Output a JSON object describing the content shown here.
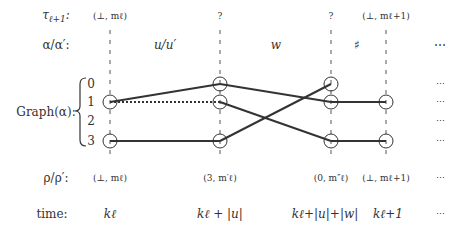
{
  "rows": {
    "tau": "τ",
    "tau_sub": "ℓ+1",
    "tau_suffix": ":",
    "alpha": "α/α′:",
    "graph": "Graph(α):",
    "rho": "ρ/ρ′:",
    "time": "time:"
  },
  "tau_values": [
    "(⊥, mℓ)",
    "?",
    "?",
    "(⊥, mℓ+1)"
  ],
  "segments": [
    "u/u′",
    "w",
    "♯",
    "⋯"
  ],
  "graph_row_labels": [
    "0",
    "1",
    "2",
    "3"
  ],
  "graph_ellipsis": [
    "⋯",
    "⋯",
    "⋯",
    "⋯"
  ],
  "rho_values": [
    "(⊥, mℓ)",
    "(3, m′ℓ)",
    "(0, m″ℓ)",
    "(⊥, mℓ+1)",
    "⋯"
  ],
  "time_values": [
    "kℓ",
    "kℓ + |u|",
    "kℓ+|u|+|w|",
    "kℓ+1",
    "⋯"
  ],
  "colors": {
    "ink": "#333333",
    "dash": "#555555"
  }
}
